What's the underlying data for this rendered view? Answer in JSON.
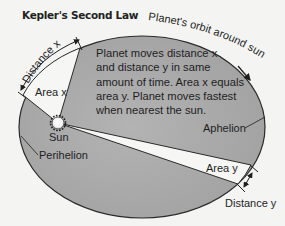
{
  "title": "Kepler's Second Law",
  "description_lines": [
    "Planet moves distance x",
    "and distance y in same",
    "amount of time. Area x equals",
    "area y. Planet moves fastest",
    "when nearest the sun."
  ],
  "labels": {
    "orbit": "Planet's orbit around sun",
    "distance_x": "Distance x",
    "area_x": "Area x",
    "sun": "Sun",
    "perihelion": "Perihelion",
    "aphelion": "Aphelion",
    "area_y": "Area y",
    "distance_y": "Distance y"
  },
  "colors": {
    "background": "#f4f4f2",
    "orbit_fill": "#a9a9a9",
    "wedge_fill": "#f6f6f4",
    "stroke": "#2a2a2a"
  }
}
